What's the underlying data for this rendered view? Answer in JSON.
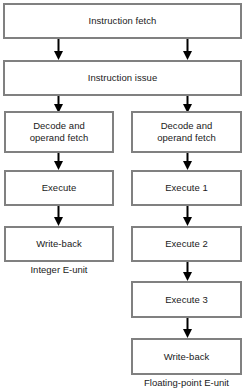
{
  "diagram": {
    "colors": {
      "box_border": "#808080",
      "box_fill": "#ffffff",
      "arrow": "#000000",
      "text": "#1a1a1a",
      "background": "#ffffff"
    },
    "shared_stages": [
      {
        "id": "instruction-fetch",
        "label": "Instruction fetch"
      },
      {
        "id": "instruction-issue",
        "label": "Instruction issue"
      }
    ],
    "integer_unit": {
      "caption": "Integer E-unit",
      "stages": [
        {
          "id": "int-decode",
          "label": "Decode and\noperand fetch"
        },
        {
          "id": "int-execute",
          "label": "Execute"
        },
        {
          "id": "int-write-back",
          "label": "Write-back"
        }
      ]
    },
    "floating_point_unit": {
      "caption": "Floating-point E-unit",
      "stages": [
        {
          "id": "fp-decode",
          "label": "Decode and\noperand fetch"
        },
        {
          "id": "fp-execute-1",
          "label": "Execute 1"
        },
        {
          "id": "fp-execute-2",
          "label": "Execute 2"
        },
        {
          "id": "fp-execute-3",
          "label": "Execute 3"
        },
        {
          "id": "fp-write-back",
          "label": "Write-back"
        }
      ]
    },
    "arrow_count": 12
  }
}
